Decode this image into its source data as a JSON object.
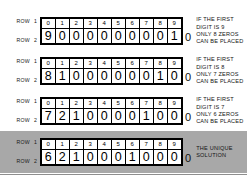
{
  "blocks": [
    {
      "id": "block-9",
      "highlighted": false,
      "row1_caption": "ROW",
      "row1_number": "1",
      "row2_caption": "ROW",
      "row2_number": "2",
      "index_row": [
        "0",
        "1",
        "2",
        "3",
        "4",
        "5",
        "6",
        "7",
        "8",
        "9"
      ],
      "value_row": [
        "9",
        "0",
        "0",
        "0",
        "0",
        "0",
        "0",
        "0",
        "0",
        "1"
      ],
      "trailing_zero": "0",
      "note": [
        "IF THE FIRST",
        "DIGIT IS 9",
        "ONLY 8 ZEROS",
        "CAN BE PLACED"
      ]
    },
    {
      "id": "block-8",
      "highlighted": false,
      "row1_caption": "ROW",
      "row1_number": "1",
      "row2_caption": "ROW",
      "row2_number": "2",
      "index_row": [
        "0",
        "1",
        "2",
        "3",
        "4",
        "5",
        "6",
        "7",
        "8",
        "9"
      ],
      "value_row": [
        "8",
        "1",
        "0",
        "0",
        "0",
        "0",
        "0",
        "0",
        "1",
        "0"
      ],
      "trailing_zero": "0",
      "note": [
        "IF THE FIRST",
        "DIGIT IS 8",
        "ONLY 7 ZEROS",
        "CAN BE PLACED"
      ]
    },
    {
      "id": "block-7",
      "highlighted": false,
      "row1_caption": "ROW",
      "row1_number": "1",
      "row2_caption": "ROW",
      "row2_number": "2",
      "index_row": [
        "0",
        "1",
        "2",
        "3",
        "4",
        "5",
        "6",
        "7",
        "8",
        "9"
      ],
      "value_row": [
        "7",
        "2",
        "1",
        "0",
        "0",
        "0",
        "0",
        "1",
        "0",
        "0"
      ],
      "trailing_zero": "0",
      "note": [
        "IF THE FIRST",
        "DIGIT IS 7",
        "ONLY 6 ZEROS",
        "CAN BE PLACED"
      ]
    },
    {
      "id": "block-solution",
      "highlighted": true,
      "row1_caption": "ROW",
      "row1_number": "1",
      "row2_caption": "ROW",
      "row2_number": "2",
      "index_row": [
        "0",
        "1",
        "2",
        "3",
        "4",
        "5",
        "6",
        "7",
        "8",
        "9"
      ],
      "value_row": [
        "6",
        "2",
        "1",
        "0",
        "0",
        "0",
        "1",
        "0",
        "0",
        "0"
      ],
      "trailing_zero": "0",
      "note": [
        "THE UNIQUE",
        "SOLUTION"
      ]
    }
  ],
  "colors": {
    "grid_border": "#000000",
    "cell_background": "#ffffff",
    "highlight_background": "#a8a8a8",
    "text": "#141414"
  }
}
